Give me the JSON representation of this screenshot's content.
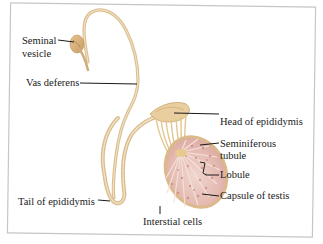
{
  "figure": {
    "colors": {
      "tube": "#e6cfa4",
      "tube_dark": "#c9a36b",
      "testis_fill": "#e8c4bd",
      "testis_tubule": "#c98b84",
      "capsule": "#dcb98a",
      "frame": "#c9c9c9",
      "label_text": "#1a1a1a"
    },
    "labels": {
      "seminal_vesicle_line1": "Seminal",
      "seminal_vesicle_line2": "vesicle",
      "vas_deferens": "Vas deferens",
      "head_of_epididymis": "Head of epididymis",
      "seminiferous_line1": "Seminiferous",
      "seminiferous_line2": "tubule",
      "lobule": "Lobule",
      "capsule_of_testis": "Capsule of testis",
      "tail_of_epididymis": "Tail of epididymis",
      "interstitial_cells": "Interstial cells"
    }
  }
}
